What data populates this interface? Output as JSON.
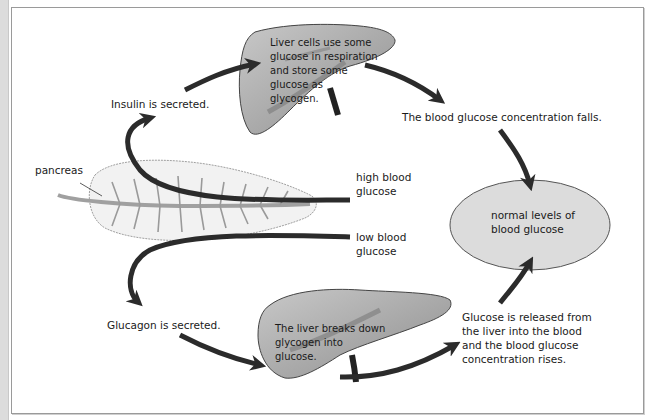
{
  "diagram": {
    "colors": {
      "arrow": "#2b2b2b",
      "liver_fill": "#a9a9a9",
      "liver_stroke": "#444444",
      "pancreas_fill": "#f2f2f2",
      "pancreas_duct": "#a0a0a0",
      "ellipse_fill": "#dcdcdc",
      "frame_border": "#9a9a9a"
    },
    "labels": {
      "insulin": "Insulin is secreted.",
      "liver_top": "Liver cells use some\nglucose in respiration\nand store some\nglucose as\nglycogen.",
      "falls": "The blood glucose concentration falls.",
      "pancreas": "pancreas",
      "high": "high blood\nglucose",
      "low": "low blood\nglucose",
      "normal": "normal levels of\nblood glucose",
      "glucagon": "Glucagon is secreted.",
      "liver_bottom": "The liver breaks down\nglycogen into\nglucose.",
      "rises": "Glucose is released from\nthe liver into the blood\nand the blood glucose\nconcentration rises."
    }
  }
}
